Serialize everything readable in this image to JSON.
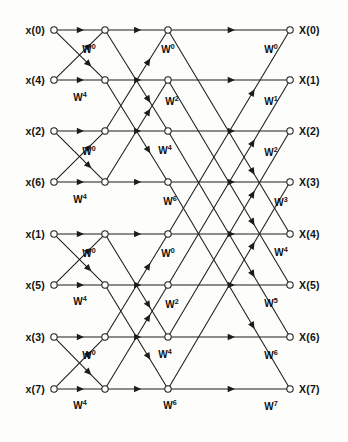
{
  "figure": {
    "stage_count": 3,
    "node_count_per_column": 8,
    "column_count": 4,
    "colors": {
      "background": "#fdfdfb",
      "line": "#1c1c1c",
      "text": "#121212"
    }
  },
  "inputs": [
    {
      "label": "x(0)",
      "row": 0
    },
    {
      "label": "x(4)",
      "row": 1
    },
    {
      "label": "x(2)",
      "row": 2
    },
    {
      "label": "x(6)",
      "row": 3
    },
    {
      "label": "x(1)",
      "row": 4
    },
    {
      "label": "x(5)",
      "row": 5
    },
    {
      "label": "x(3)",
      "row": 6
    },
    {
      "label": "x(7)",
      "row": 7
    }
  ],
  "outputs": [
    {
      "label": "X(0)",
      "row": 0
    },
    {
      "label": "X(1)",
      "row": 1
    },
    {
      "label": "X(2)",
      "row": 2
    },
    {
      "label": "X(3)",
      "row": 3
    },
    {
      "label": "X(4)",
      "row": 4
    },
    {
      "label": "X(5)",
      "row": 5
    },
    {
      "label": "X(6)",
      "row": 6
    },
    {
      "label": "X(7)",
      "row": 7
    }
  ],
  "geometry": {
    "columns_x": [
      54,
      105,
      168,
      290
    ],
    "rows_y": [
      30,
      80,
      131,
      182,
      234,
      285,
      337,
      389
    ],
    "node_radius": 3.2,
    "width": 348,
    "height": 442
  },
  "twiddle_symbol": "W",
  "twiddle_labels": [
    {
      "base": "W",
      "exp": "0",
      "x": 89,
      "y": 53,
      "stage": 1
    },
    {
      "base": "W",
      "exp": "4",
      "x": 80,
      "y": 101,
      "stage": 1
    },
    {
      "base": "W",
      "exp": "0",
      "x": 89,
      "y": 155,
      "stage": 1
    },
    {
      "base": "W",
      "exp": "4",
      "x": 80,
      "y": 203,
      "stage": 1
    },
    {
      "base": "W",
      "exp": "0",
      "x": 89,
      "y": 257,
      "stage": 1
    },
    {
      "base": "W",
      "exp": "4",
      "x": 80,
      "y": 305,
      "stage": 1
    },
    {
      "base": "W",
      "exp": "0",
      "x": 89,
      "y": 359,
      "stage": 1
    },
    {
      "base": "W",
      "exp": "4",
      "x": 80,
      "y": 409,
      "stage": 1
    },
    {
      "base": "W",
      "exp": "0",
      "x": 168,
      "y": 53,
      "stage": 2
    },
    {
      "base": "W",
      "exp": "2",
      "x": 172,
      "y": 105,
      "stage": 2
    },
    {
      "base": "W",
      "exp": "4",
      "x": 165,
      "y": 154,
      "stage": 2
    },
    {
      "base": "W",
      "exp": "6",
      "x": 170,
      "y": 205,
      "stage": 2
    },
    {
      "base": "W",
      "exp": "0",
      "x": 168,
      "y": 257,
      "stage": 2
    },
    {
      "base": "W",
      "exp": "2",
      "x": 172,
      "y": 308,
      "stage": 2
    },
    {
      "base": "W",
      "exp": "4",
      "x": 165,
      "y": 358,
      "stage": 2
    },
    {
      "base": "W",
      "exp": "6",
      "x": 170,
      "y": 409,
      "stage": 2
    },
    {
      "base": "W",
      "exp": "0",
      "x": 271,
      "y": 53,
      "stage": 3
    },
    {
      "base": "W",
      "exp": "1",
      "x": 271,
      "y": 105,
      "stage": 3
    },
    {
      "base": "W",
      "exp": "2",
      "x": 271,
      "y": 156,
      "stage": 3
    },
    {
      "base": "W",
      "exp": "3",
      "x": 281,
      "y": 206,
      "stage": 3
    },
    {
      "base": "W",
      "exp": "4",
      "x": 281,
      "y": 256,
      "stage": 3
    },
    {
      "base": "W",
      "exp": "5",
      "x": 271,
      "y": 307,
      "stage": 3
    },
    {
      "base": "W",
      "exp": "6",
      "x": 271,
      "y": 359,
      "stage": 3
    },
    {
      "base": "W",
      "exp": "7",
      "x": 271,
      "y": 410,
      "stage": 3
    }
  ],
  "edges": [
    {
      "stage": 1,
      "from_col": 0,
      "to_col": 1,
      "from_row": 0,
      "to_row": 0,
      "kind": "straight"
    },
    {
      "stage": 1,
      "from_col": 0,
      "to_col": 1,
      "from_row": 0,
      "to_row": 1,
      "kind": "cross"
    },
    {
      "stage": 1,
      "from_col": 0,
      "to_col": 1,
      "from_row": 1,
      "to_row": 0,
      "kind": "cross"
    },
    {
      "stage": 1,
      "from_col": 0,
      "to_col": 1,
      "from_row": 1,
      "to_row": 1,
      "kind": "straight"
    },
    {
      "stage": 1,
      "from_col": 0,
      "to_col": 1,
      "from_row": 2,
      "to_row": 2,
      "kind": "straight"
    },
    {
      "stage": 1,
      "from_col": 0,
      "to_col": 1,
      "from_row": 2,
      "to_row": 3,
      "kind": "cross"
    },
    {
      "stage": 1,
      "from_col": 0,
      "to_col": 1,
      "from_row": 3,
      "to_row": 2,
      "kind": "cross"
    },
    {
      "stage": 1,
      "from_col": 0,
      "to_col": 1,
      "from_row": 3,
      "to_row": 3,
      "kind": "straight"
    },
    {
      "stage": 1,
      "from_col": 0,
      "to_col": 1,
      "from_row": 4,
      "to_row": 4,
      "kind": "straight"
    },
    {
      "stage": 1,
      "from_col": 0,
      "to_col": 1,
      "from_row": 4,
      "to_row": 5,
      "kind": "cross"
    },
    {
      "stage": 1,
      "from_col": 0,
      "to_col": 1,
      "from_row": 5,
      "to_row": 4,
      "kind": "cross"
    },
    {
      "stage": 1,
      "from_col": 0,
      "to_col": 1,
      "from_row": 5,
      "to_row": 5,
      "kind": "straight"
    },
    {
      "stage": 1,
      "from_col": 0,
      "to_col": 1,
      "from_row": 6,
      "to_row": 6,
      "kind": "straight"
    },
    {
      "stage": 1,
      "from_col": 0,
      "to_col": 1,
      "from_row": 6,
      "to_row": 7,
      "kind": "cross"
    },
    {
      "stage": 1,
      "from_col": 0,
      "to_col": 1,
      "from_row": 7,
      "to_row": 6,
      "kind": "cross"
    },
    {
      "stage": 1,
      "from_col": 0,
      "to_col": 1,
      "from_row": 7,
      "to_row": 7,
      "kind": "straight"
    },
    {
      "stage": 2,
      "from_col": 1,
      "to_col": 2,
      "from_row": 0,
      "to_row": 0,
      "kind": "straight"
    },
    {
      "stage": 2,
      "from_col": 1,
      "to_col": 2,
      "from_row": 0,
      "to_row": 2,
      "kind": "cross"
    },
    {
      "stage": 2,
      "from_col": 1,
      "to_col": 2,
      "from_row": 1,
      "to_row": 1,
      "kind": "straight"
    },
    {
      "stage": 2,
      "from_col": 1,
      "to_col": 2,
      "from_row": 1,
      "to_row": 3,
      "kind": "cross"
    },
    {
      "stage": 2,
      "from_col": 1,
      "to_col": 2,
      "from_row": 2,
      "to_row": 0,
      "kind": "cross"
    },
    {
      "stage": 2,
      "from_col": 1,
      "to_col": 2,
      "from_row": 2,
      "to_row": 2,
      "kind": "straight"
    },
    {
      "stage": 2,
      "from_col": 1,
      "to_col": 2,
      "from_row": 3,
      "to_row": 1,
      "kind": "cross"
    },
    {
      "stage": 2,
      "from_col": 1,
      "to_col": 2,
      "from_row": 3,
      "to_row": 3,
      "kind": "straight"
    },
    {
      "stage": 2,
      "from_col": 1,
      "to_col": 2,
      "from_row": 4,
      "to_row": 4,
      "kind": "straight"
    },
    {
      "stage": 2,
      "from_col": 1,
      "to_col": 2,
      "from_row": 4,
      "to_row": 6,
      "kind": "cross"
    },
    {
      "stage": 2,
      "from_col": 1,
      "to_col": 2,
      "from_row": 5,
      "to_row": 5,
      "kind": "straight"
    },
    {
      "stage": 2,
      "from_col": 1,
      "to_col": 2,
      "from_row": 5,
      "to_row": 7,
      "kind": "cross"
    },
    {
      "stage": 2,
      "from_col": 1,
      "to_col": 2,
      "from_row": 6,
      "to_row": 4,
      "kind": "cross"
    },
    {
      "stage": 2,
      "from_col": 1,
      "to_col": 2,
      "from_row": 6,
      "to_row": 6,
      "kind": "straight"
    },
    {
      "stage": 2,
      "from_col": 1,
      "to_col": 2,
      "from_row": 7,
      "to_row": 5,
      "kind": "cross"
    },
    {
      "stage": 2,
      "from_col": 1,
      "to_col": 2,
      "from_row": 7,
      "to_row": 7,
      "kind": "straight"
    },
    {
      "stage": 3,
      "from_col": 2,
      "to_col": 3,
      "from_row": 0,
      "to_row": 0,
      "kind": "straight"
    },
    {
      "stage": 3,
      "from_col": 2,
      "to_col": 3,
      "from_row": 0,
      "to_row": 4,
      "kind": "cross"
    },
    {
      "stage": 3,
      "from_col": 2,
      "to_col": 3,
      "from_row": 1,
      "to_row": 1,
      "kind": "straight"
    },
    {
      "stage": 3,
      "from_col": 2,
      "to_col": 3,
      "from_row": 1,
      "to_row": 5,
      "kind": "cross"
    },
    {
      "stage": 3,
      "from_col": 2,
      "to_col": 3,
      "from_row": 2,
      "to_row": 2,
      "kind": "straight"
    },
    {
      "stage": 3,
      "from_col": 2,
      "to_col": 3,
      "from_row": 2,
      "to_row": 6,
      "kind": "cross"
    },
    {
      "stage": 3,
      "from_col": 2,
      "to_col": 3,
      "from_row": 3,
      "to_row": 3,
      "kind": "straight"
    },
    {
      "stage": 3,
      "from_col": 2,
      "to_col": 3,
      "from_row": 3,
      "to_row": 7,
      "kind": "cross"
    },
    {
      "stage": 3,
      "from_col": 2,
      "to_col": 3,
      "from_row": 4,
      "to_row": 0,
      "kind": "cross"
    },
    {
      "stage": 3,
      "from_col": 2,
      "to_col": 3,
      "from_row": 4,
      "to_row": 4,
      "kind": "straight"
    },
    {
      "stage": 3,
      "from_col": 2,
      "to_col": 3,
      "from_row": 5,
      "to_row": 1,
      "kind": "cross"
    },
    {
      "stage": 3,
      "from_col": 2,
      "to_col": 3,
      "from_row": 5,
      "to_row": 5,
      "kind": "straight"
    },
    {
      "stage": 3,
      "from_col": 2,
      "to_col": 3,
      "from_row": 6,
      "to_row": 2,
      "kind": "cross"
    },
    {
      "stage": 3,
      "from_col": 2,
      "to_col": 3,
      "from_row": 6,
      "to_row": 6,
      "kind": "straight"
    },
    {
      "stage": 3,
      "from_col": 2,
      "to_col": 3,
      "from_row": 7,
      "to_row": 3,
      "kind": "cross"
    },
    {
      "stage": 3,
      "from_col": 2,
      "to_col": 3,
      "from_row": 7,
      "to_row": 7,
      "kind": "straight"
    }
  ]
}
